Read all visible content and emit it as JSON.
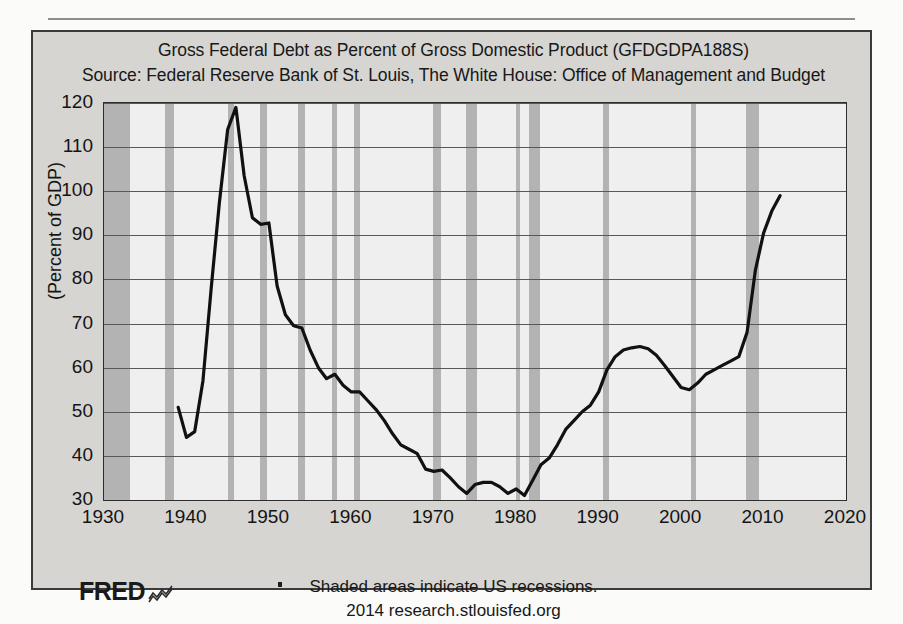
{
  "chart_data": {
    "type": "line",
    "title": "Gross Federal Debt as Percent of Gross Domestic Product (GFDGDPA188S)",
    "subtitle": "Source: Federal Reserve Bank of St. Louis, The White House: Office of Management and Budget",
    "ylabel": "(Percent of GDP)",
    "xlabel": "",
    "xlim": [
      1930,
      2020
    ],
    "ylim": [
      30,
      120
    ],
    "xticks": [
      1930,
      1940,
      1950,
      1960,
      1970,
      1980,
      1990,
      2000,
      2010,
      2020
    ],
    "yticks": [
      30,
      40,
      50,
      60,
      70,
      80,
      90,
      100,
      110,
      120
    ],
    "grid": "horizontal",
    "legend": "none",
    "line_color": "#111111",
    "plot_bg": "#efefef",
    "recession_band_color": "#b3b3b3",
    "series": [
      {
        "name": "Gross Federal Debt as Percent of GDP",
        "x": [
          1939,
          1940,
          1941,
          1942,
          1943,
          1944,
          1945,
          1946,
          1947,
          1948,
          1949,
          1950,
          1951,
          1952,
          1953,
          1954,
          1955,
          1956,
          1957,
          1958,
          1959,
          1960,
          1961,
          1962,
          1963,
          1964,
          1965,
          1966,
          1967,
          1968,
          1969,
          1970,
          1971,
          1972,
          1973,
          1974,
          1975,
          1976,
          1977,
          1978,
          1979,
          1980,
          1981,
          1982,
          1983,
          1984,
          1985,
          1986,
          1987,
          1988,
          1989,
          1990,
          1991,
          1992,
          1993,
          1994,
          1995,
          1996,
          1997,
          1998,
          1999,
          2000,
          2001,
          2002,
          2003,
          2004,
          2005,
          2006,
          2007,
          2008,
          2009,
          2010,
          2011,
          2012
        ],
        "y": [
          51.0,
          44.2,
          45.5,
          57.0,
          78.0,
          97.5,
          114.0,
          119.0,
          103.5,
          94.0,
          92.5,
          92.8,
          78.5,
          72.0,
          69.5,
          69.0,
          64.0,
          60.0,
          57.5,
          58.5,
          56.0,
          54.5,
          54.5,
          52.5,
          50.5,
          48.0,
          45.0,
          42.5,
          41.5,
          40.5,
          37.0,
          36.5,
          36.8,
          35.0,
          33.0,
          31.5,
          33.5,
          34.0,
          34.0,
          33.0,
          31.5,
          32.5,
          31.0,
          34.5,
          38.0,
          39.5,
          42.5,
          46.0,
          48.0,
          50.0,
          51.5,
          54.5,
          59.5,
          62.5,
          64.0,
          64.5,
          64.8,
          64.3,
          62.8,
          60.5,
          58.0,
          55.5,
          55.0,
          56.5,
          58.5,
          59.5,
          60.5,
          61.5,
          62.5,
          68.0,
          82.0,
          90.5,
          95.5,
          99.0
        ]
      }
    ],
    "recessions": [
      {
        "start": 1929.6,
        "end": 1933.2
      },
      {
        "start": 1937.4,
        "end": 1938.5
      },
      {
        "start": 1945.1,
        "end": 1945.8
      },
      {
        "start": 1948.9,
        "end": 1949.8
      },
      {
        "start": 1953.5,
        "end": 1954.4
      },
      {
        "start": 1957.6,
        "end": 1958.3
      },
      {
        "start": 1960.3,
        "end": 1961.1
      },
      {
        "start": 1969.9,
        "end": 1970.9
      },
      {
        "start": 1973.9,
        "end": 1975.2
      },
      {
        "start": 1980.0,
        "end": 1980.5
      },
      {
        "start": 1981.5,
        "end": 1982.9
      },
      {
        "start": 1990.5,
        "end": 1991.2
      },
      {
        "start": 2001.2,
        "end": 2001.8
      },
      {
        "start": 2007.9,
        "end": 2009.5
      }
    ]
  },
  "footer": {
    "logo_text": "FRED",
    "note": "Shaded areas indicate US recessions.",
    "attribution": "2014 research.stlouisfed.org"
  }
}
